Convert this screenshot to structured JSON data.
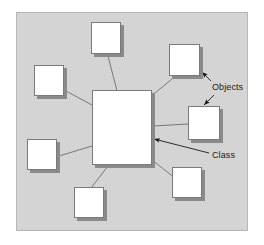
{
  "diagram": {
    "type": "node-link",
    "canvas": {
      "width": 264,
      "height": 245,
      "background": "#ffffff"
    },
    "panel": {
      "name": "diagram-panel",
      "x": 16,
      "y": 12,
      "width": 232,
      "height": 219,
      "fill": "#d4d4d4",
      "stroke": "#b6b6b6"
    },
    "style": {
      "node_fill": "#ffffff",
      "node_stroke": "#7a7a7a",
      "node_shadow": "#8a8a8a",
      "edge_stroke": "#6e6e6e",
      "arrow_color": "#1a1a1a",
      "text_color": "#1a1a1a"
    },
    "center_node": {
      "name": "class-node",
      "role": "Class",
      "x": 92,
      "y": 90,
      "width": 60,
      "height": 75,
      "label": ""
    },
    "object_nodes": [
      {
        "name": "object-node-top",
        "role": "Object",
        "x": 91,
        "y": 22,
        "width": 30,
        "height": 32,
        "label": ""
      },
      {
        "name": "object-node-top-right",
        "role": "Object",
        "x": 169,
        "y": 44,
        "width": 31,
        "height": 32,
        "label": ""
      },
      {
        "name": "object-node-left-upper",
        "role": "Object",
        "x": 34,
        "y": 65,
        "width": 30,
        "height": 31,
        "label": ""
      },
      {
        "name": "object-node-right-middle",
        "role": "Object",
        "x": 188,
        "y": 106,
        "width": 32,
        "height": 34,
        "label": ""
      },
      {
        "name": "object-node-left-lower",
        "role": "Object",
        "x": 27,
        "y": 139,
        "width": 30,
        "height": 31,
        "label": ""
      },
      {
        "name": "object-node-bottom-right",
        "role": "Object",
        "x": 172,
        "y": 167,
        "width": 30,
        "height": 31,
        "label": ""
      },
      {
        "name": "object-node-bottom",
        "role": "Object",
        "x": 74,
        "y": 187,
        "width": 30,
        "height": 31,
        "label": ""
      }
    ],
    "edges": [
      {
        "name": "edge-class-to-top",
        "from": "class-node",
        "to": "object-node-top",
        "x1": 117,
        "y1": 91,
        "x2": 108,
        "y2": 56
      },
      {
        "name": "edge-class-to-top-right",
        "from": "class-node",
        "to": "object-node-top-right",
        "x1": 150,
        "y1": 97,
        "x2": 172,
        "y2": 79
      },
      {
        "name": "edge-class-to-left-upper",
        "from": "class-node",
        "to": "object-node-left-upper",
        "x1": 92,
        "y1": 105,
        "x2": 66,
        "y2": 91
      },
      {
        "name": "edge-class-to-right-middle",
        "from": "class-node",
        "to": "object-node-right-middle",
        "x1": 153,
        "y1": 126,
        "x2": 188,
        "y2": 124
      },
      {
        "name": "edge-class-to-left-lower",
        "from": "class-node",
        "to": "object-node-left-lower",
        "x1": 92,
        "y1": 146,
        "x2": 59,
        "y2": 156
      },
      {
        "name": "edge-class-to-bottom-right",
        "from": "class-node",
        "to": "object-node-bottom-right",
        "x1": 152,
        "y1": 160,
        "x2": 175,
        "y2": 178
      },
      {
        "name": "edge-class-to-bottom",
        "from": "class-node",
        "to": "object-node-bottom",
        "x1": 108,
        "y1": 166,
        "x2": 91,
        "y2": 188
      }
    ],
    "annotations": [
      {
        "name": "objects-annotation",
        "text": "Objects",
        "text_x": 212,
        "text_y": 82,
        "leaders": [
          {
            "name": "objects-leader-upper",
            "x1": 211,
            "y1": 81,
            "x2": 202,
            "y2": 72
          },
          {
            "name": "objects-leader-lower",
            "x1": 214,
            "y1": 95,
            "x2": 204,
            "y2": 105
          }
        ]
      },
      {
        "name": "class-annotation",
        "text": "Class",
        "text_x": 212,
        "text_y": 150,
        "leaders": [
          {
            "name": "class-leader",
            "x1": 209,
            "y1": 153,
            "x2": 154,
            "y2": 139
          }
        ]
      }
    ]
  }
}
